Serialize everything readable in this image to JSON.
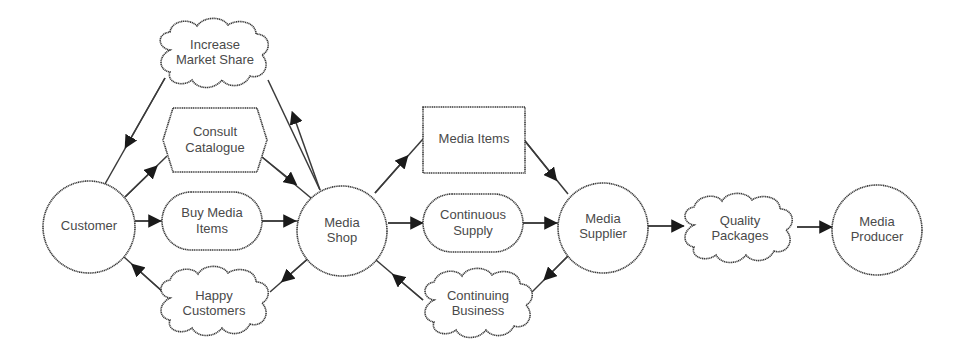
{
  "diagram": {
    "type": "i* strategic dependency model",
    "actors": [
      {
        "id": "customer",
        "label": [
          "Customer"
        ]
      },
      {
        "id": "media_shop",
        "label": [
          "Media",
          "Shop"
        ]
      },
      {
        "id": "media_supplier",
        "label": [
          "Media",
          "Supplier"
        ]
      },
      {
        "id": "media_producer",
        "label": [
          "Media",
          "Producer"
        ]
      }
    ],
    "dependums": [
      {
        "id": "increase_market_share",
        "kind": "softgoal",
        "label": [
          "Increase",
          "Market Share"
        ]
      },
      {
        "id": "consult_catalogue",
        "kind": "task",
        "label": [
          "Consult",
          "Catalogue"
        ]
      },
      {
        "id": "buy_media_items",
        "kind": "goal",
        "label": [
          "Buy Media",
          "Items"
        ]
      },
      {
        "id": "happy_customers",
        "kind": "softgoal",
        "label": [
          "Happy",
          "Customers"
        ]
      },
      {
        "id": "media_items",
        "kind": "resource",
        "label": [
          "Media Items"
        ]
      },
      {
        "id": "continuous_supply",
        "kind": "goal",
        "label": [
          "Continuous",
          "Supply"
        ]
      },
      {
        "id": "continuing_business",
        "kind": "softgoal",
        "label": [
          "Continuing",
          "Business"
        ]
      },
      {
        "id": "quality_packages",
        "kind": "softgoal",
        "label": [
          "Quality",
          "Packages"
        ]
      }
    ],
    "dependencies": [
      {
        "depender": "media_shop",
        "dependum": "increase_market_share",
        "dependee": "customer"
      },
      {
        "depender": "customer",
        "dependum": "consult_catalogue",
        "dependee": "media_shop"
      },
      {
        "depender": "customer",
        "dependum": "buy_media_items",
        "dependee": "media_shop"
      },
      {
        "depender": "media_shop",
        "dependum": "happy_customers",
        "dependee": "customer"
      },
      {
        "depender": "media_shop",
        "dependum": "media_items",
        "dependee": "media_supplier"
      },
      {
        "depender": "media_shop",
        "dependum": "continuous_supply",
        "dependee": "media_supplier"
      },
      {
        "depender": "media_supplier",
        "dependum": "continuing_business",
        "dependee": "media_shop"
      },
      {
        "depender": "media_supplier",
        "dependum": "quality_packages",
        "dependee": "media_producer"
      }
    ]
  }
}
